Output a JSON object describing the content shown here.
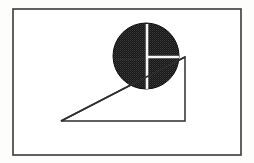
{
  "document": {
    "title": "Geometric Figure",
    "description": "Line drawing of a dark shaded circle resting on the upper vertex of a right triangle, enclosed in a rectangular border"
  },
  "canvas": {
    "width": 254,
    "height": 163,
    "background_color": "#fdfdfc"
  },
  "figure": {
    "frame": {
      "label": "Outer rectangular border",
      "x": 13,
      "y": 9,
      "width": 228,
      "height": 146,
      "stroke_color": "#3a3a3a",
      "stroke_width": 1.6,
      "fill_color": "#ffffff"
    },
    "triangle": {
      "label": "Right triangle",
      "points": "61,121 185,121 185,57",
      "vertices": [
        {
          "name": "bottom-left",
          "x": 61,
          "y": 121
        },
        {
          "name": "bottom-right",
          "x": 185,
          "y": 121
        },
        {
          "name": "top-right",
          "x": 185,
          "y": 57
        }
      ],
      "stroke_color": "#2e2e2e",
      "stroke_width": 1.5,
      "fill_color": "#ffffff"
    },
    "circle": {
      "label": "Shaded circle",
      "cx": 146,
      "cy": 56,
      "r": 33,
      "fill_color": "#1c1c1c",
      "texture": "halftone-dither",
      "stroke_color": "#0d0d0d",
      "stroke_width": 1
    },
    "crosshair": {
      "label": "White cross lines inside circle",
      "stroke_color": "#f6f6f4",
      "vertical": {
        "x": 147,
        "y1": 24,
        "y2": 89,
        "stroke_width": 2.6
      },
      "horizontal": {
        "y": 57,
        "x1": 147,
        "x2": 179,
        "stroke_width": 2.4
      }
    },
    "overlay_lines": {
      "label": "Triangle edges visible across the circle",
      "stroke_color": "#2e2e2e",
      "stroke_width": 1.5,
      "hypotenuse": {
        "x1": 61,
        "y1": 121,
        "x2": 185,
        "y2": 57
      },
      "top_edge": {
        "x1": 115,
        "y1": 60,
        "x2": 185,
        "y2": 57
      }
    }
  }
}
